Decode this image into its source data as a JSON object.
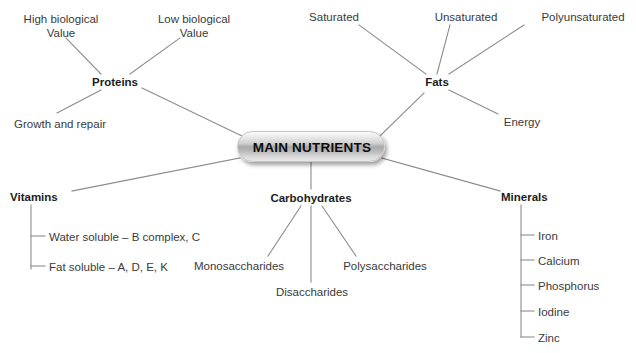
{
  "diagram": {
    "title": "MAIN NUTRIENTS",
    "type": "mind-map",
    "center": {
      "label": "MAIN NUTRIENTS",
      "x": 311,
      "y": 146,
      "width": 148,
      "height": 31,
      "shape": "rounded-rectangle",
      "fill_top": "#fdfdfd",
      "fill_mid": "#a9a9a9",
      "fill_bottom": "#e8e8e8",
      "text_color": "#0d0d0d"
    },
    "edge_color": "#8c8c8c",
    "branch_text_color": "#1d1d1d",
    "leaf_text_color": "#3a3a3a",
    "branches": [
      {
        "id": "proteins",
        "label": "Proteins",
        "x": 115,
        "y": 82,
        "connector": "radial",
        "children": [
          {
            "id": "high-biological-value",
            "label": "High biological\nValue",
            "line1": "High biological",
            "line2": "Value",
            "x": 61,
            "y": 19
          },
          {
            "id": "low-biological-value",
            "label": "Low biological\nValue",
            "line1": "Low biological",
            "line2": "Value",
            "x": 194,
            "y": 19
          },
          {
            "id": "growth-and-repair",
            "label": "Growth and repair",
            "x": 60,
            "y": 124
          }
        ]
      },
      {
        "id": "fats",
        "label": "Fats",
        "x": 437,
        "y": 82,
        "connector": "radial",
        "children": [
          {
            "id": "saturated",
            "label": "Saturated",
            "x": 334,
            "y": 17
          },
          {
            "id": "unsaturated",
            "label": "Unsaturated",
            "x": 466,
            "y": 17
          },
          {
            "id": "polyunsaturated",
            "label": "Polyunsaturated",
            "x": 583,
            "y": 17
          },
          {
            "id": "energy",
            "label": "Energy",
            "x": 522,
            "y": 122
          }
        ]
      },
      {
        "id": "vitamins",
        "label": "Vitamins",
        "x": 38,
        "y": 197,
        "connector": "orthogonal",
        "children": [
          {
            "id": "water-soluble",
            "label": "Water soluble – B complex, C",
            "x": 49,
            "y": 239
          },
          {
            "id": "fat-soluble",
            "label": "Fat soluble – A, D, E, K",
            "x": 49,
            "y": 269
          }
        ]
      },
      {
        "id": "carbohydrates",
        "label": "Carbohydrates",
        "x": 311,
        "y": 198,
        "connector": "radial",
        "children": [
          {
            "id": "monosaccharides",
            "label": "Monosaccharides",
            "x": 239,
            "y": 266
          },
          {
            "id": "disaccharides",
            "label": "Disaccharides",
            "x": 312,
            "y": 292
          },
          {
            "id": "polysaccharides",
            "label": "Polysaccharides",
            "x": 385,
            "y": 266
          }
        ]
      },
      {
        "id": "minerals",
        "label": "Minerals",
        "x": 528,
        "y": 197,
        "connector": "orthogonal",
        "children": [
          {
            "id": "iron",
            "label": "Iron",
            "x": 538,
            "y": 238
          },
          {
            "id": "calcium",
            "label": "Calcium",
            "x": 538,
            "y": 263
          },
          {
            "id": "phosphorus",
            "label": "Phosphorus",
            "x": 538,
            "y": 288
          },
          {
            "id": "iodine",
            "label": "Iodine",
            "x": 538,
            "y": 314
          },
          {
            "id": "zinc",
            "label": "Zinc",
            "x": 538,
            "y": 340
          }
        ]
      }
    ]
  }
}
